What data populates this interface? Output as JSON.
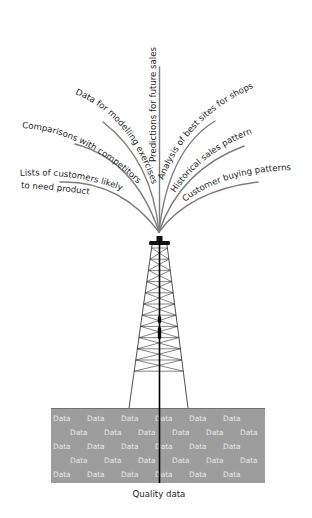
{
  "diagram": {
    "outputs": [
      {
        "id": "lists",
        "label_line1": "Lists of customers likely",
        "label_line2": "to need product"
      },
      {
        "id": "comparisons",
        "label": "Comparisons with competitors"
      },
      {
        "id": "modelling",
        "label": "Data for modelling exercises"
      },
      {
        "id": "predictions",
        "label": "Predictions for future sales"
      },
      {
        "id": "analysis",
        "label": "Analysis of best sites for shops"
      },
      {
        "id": "historical",
        "label": "Historical sales pattern"
      },
      {
        "id": "buying",
        "label": "Customer buying patterns"
      }
    ],
    "reservoir": {
      "word": "Data",
      "rows": 5,
      "caption": "Quality data"
    },
    "colors": {
      "stream": "#7d7d7d",
      "reservoir_fill": "#9d9d9d",
      "reservoir_text": "#e6e6e6",
      "derrick": "#222222"
    }
  }
}
